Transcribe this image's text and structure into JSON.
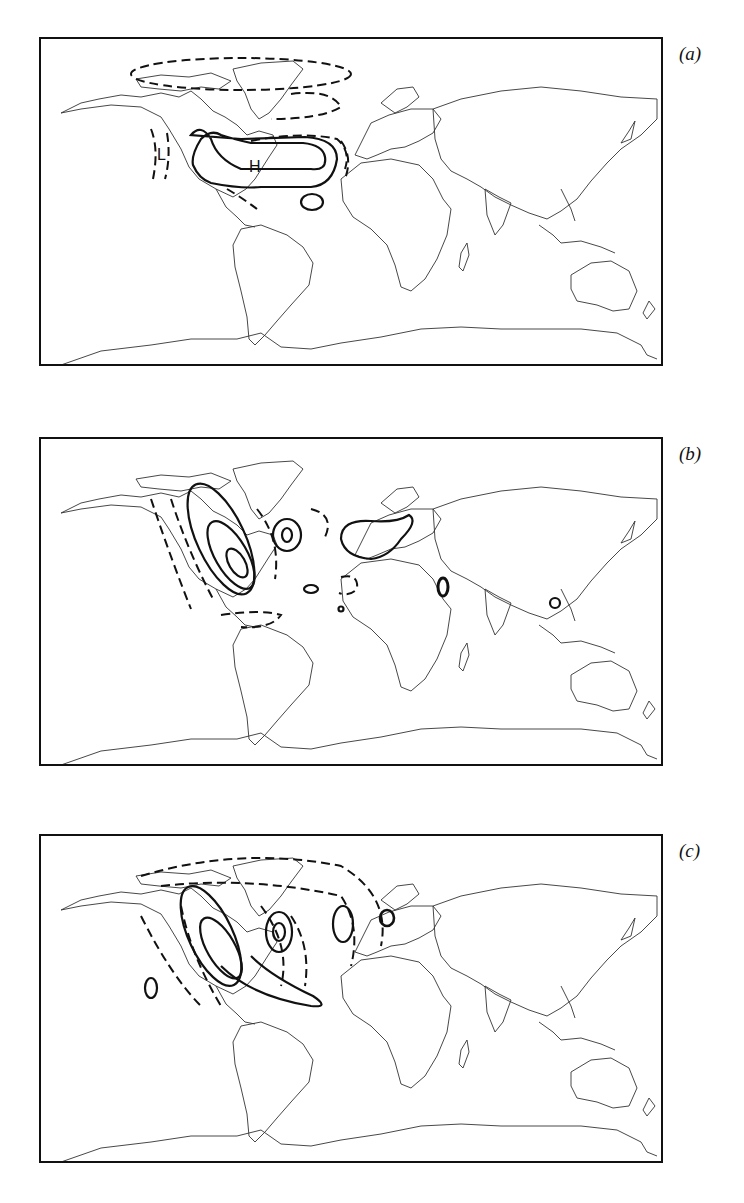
{
  "figure": {
    "panels": [
      {
        "id": "a",
        "label": "(a)",
        "centers": [
          {
            "type": "high",
            "text": "H"
          },
          {
            "type": "low",
            "text": "L"
          },
          {
            "type": "low",
            "text": "L"
          }
        ]
      },
      {
        "id": "b",
        "label": "(b)"
      },
      {
        "id": "c",
        "label": "(c)"
      }
    ],
    "legend": {
      "solid_contour": "positive anomaly",
      "dashed_contour": "negative anomaly"
    }
  },
  "colors": {
    "ink": "#111111",
    "coastline": "#333333",
    "background": "#ffffff"
  }
}
